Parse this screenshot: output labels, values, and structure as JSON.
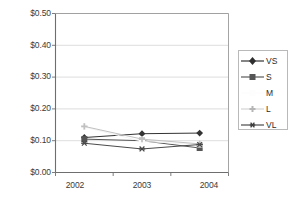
{
  "chart_data": {
    "type": "line",
    "title": "",
    "subtitle": "",
    "xlabel": "",
    "ylabel": "",
    "categories": [
      "2002",
      "2003",
      "2004"
    ],
    "x": [
      2002,
      2003,
      2004
    ],
    "ylim": [
      0.0,
      0.5
    ],
    "ytick_values": [
      0.0,
      0.1,
      0.2,
      0.3,
      0.4,
      0.5
    ],
    "ytick_labels": [
      "$0.00",
      "$0.10",
      "$0.20",
      "$0.30",
      "$0.40",
      "$0.50"
    ],
    "xtick_labels": [
      "2002",
      "2003",
      "2004"
    ],
    "grid": "horizontal",
    "legend_position": "right",
    "series": [
      {
        "name": "VS",
        "marker": "diamond",
        "color": "#333333",
        "values": [
          0.11,
          0.122,
          0.124
        ]
      },
      {
        "name": "S",
        "marker": "square",
        "color": "#555555",
        "values": [
          0.105,
          0.1,
          0.077
        ]
      },
      {
        "name": "M",
        "marker": "none",
        "color": "#f2f2f2",
        "values": [
          0.143,
          0.098,
          0.088
        ]
      },
      {
        "name": "L",
        "marker": "cross",
        "color": "#c0c0c0",
        "values": [
          0.145,
          0.105,
          0.09
        ]
      },
      {
        "name": "VL",
        "marker": "asterisk",
        "color": "#4a4a4a",
        "values": [
          0.092,
          0.074,
          0.088
        ]
      }
    ]
  },
  "legend": {
    "entries": [
      {
        "label": "VS"
      },
      {
        "label": "S"
      },
      {
        "label": "M"
      },
      {
        "label": "L"
      },
      {
        "label": "VL"
      }
    ]
  },
  "axes": {
    "y_labels": [
      "$0.50",
      "$0.40",
      "$0.30",
      "$0.20",
      "$0.10",
      "$0.00"
    ],
    "x_labels": [
      "2002",
      "2003",
      "2004"
    ]
  },
  "colors": {
    "frame": "#6e6e6e",
    "grid": "#d4d4d4",
    "text": "#3a3a3a",
    "background": "#ffffff"
  }
}
